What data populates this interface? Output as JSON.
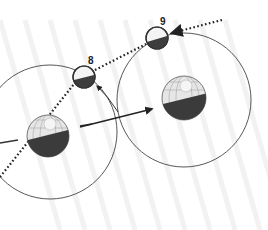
{
  "diagram": {
    "moons": [
      {
        "id": "moon-8",
        "label": "8",
        "cx": 84,
        "cy": 77,
        "r": 11
      },
      {
        "id": "moon-9",
        "label": "9",
        "cx": 157,
        "cy": 38,
        "r": 11
      }
    ],
    "earths": [
      {
        "id": "earth-left",
        "cx": 48,
        "cy": 136,
        "r": 21
      },
      {
        "id": "earth-right",
        "cx": 184,
        "cy": 98,
        "r": 22
      }
    ],
    "orbits": [
      {
        "id": "orbit-left",
        "cx": 50,
        "cy": 132,
        "r": 67
      },
      {
        "id": "orbit-right",
        "cx": 184,
        "cy": 100,
        "r": 67
      }
    ],
    "colors": {
      "line": "#333333",
      "dark": "#3a3a3a",
      "light": "#efefef",
      "stripe": "#f3f3f3",
      "background": "#ffffff"
    }
  }
}
